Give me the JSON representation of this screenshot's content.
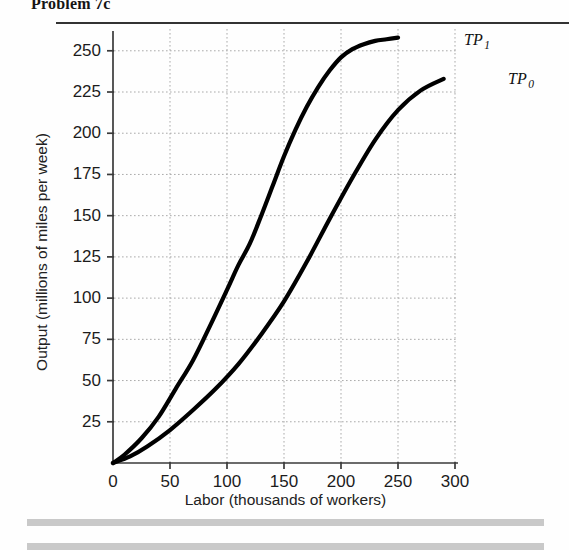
{
  "title": "Problem 7c",
  "chart_data": {
    "type": "line",
    "title": "Problem 7c",
    "xlabel": "Labor (thousands of workers)",
    "ylabel": "Output (millions of miles per week)",
    "xlim": [
      0,
      300
    ],
    "ylim": [
      0,
      262
    ],
    "xticks": [
      0,
      50,
      100,
      150,
      200,
      250,
      300
    ],
    "yticks": [
      25,
      50,
      75,
      100,
      125,
      150,
      175,
      200,
      225,
      250
    ],
    "xtick_labels": [
      "0",
      "50",
      "100",
      "150",
      "200",
      "250",
      "300"
    ],
    "ytick_labels": [
      "25",
      "50",
      "75",
      "100",
      "125",
      "150",
      "175",
      "200",
      "225",
      "250"
    ],
    "grid": true,
    "grid_style": "dotted",
    "legend": "inline-labels",
    "series": [
      {
        "name": "TP 1",
        "label": "TP",
        "subscript": "1",
        "color": "#000000",
        "x": [
          0,
          10,
          25,
          40,
          55,
          70,
          85,
          100,
          110,
          120,
          130,
          140,
          150,
          160,
          170,
          180,
          190,
          200,
          210,
          220,
          230,
          240,
          250
        ],
        "y": [
          0,
          5,
          15,
          28,
          45,
          62,
          83,
          105,
          120,
          133,
          150,
          168,
          186,
          202,
          216,
          228,
          238,
          246,
          251,
          254,
          256,
          257,
          258
        ]
      },
      {
        "name": "TP 0",
        "label": "TP",
        "subscript": "0",
        "color": "#000000",
        "x": [
          0,
          15,
          30,
          50,
          70,
          90,
          110,
          130,
          150,
          170,
          190,
          210,
          230,
          250,
          270,
          290
        ],
        "y": [
          0,
          4,
          10,
          20,
          32,
          45,
          60,
          78,
          98,
          122,
          148,
          173,
          196,
          214,
          226,
          233
        ]
      }
    ]
  },
  "axis_marks": {
    "y_axis_name": "y-axis",
    "x_axis_name": "x-axis"
  }
}
